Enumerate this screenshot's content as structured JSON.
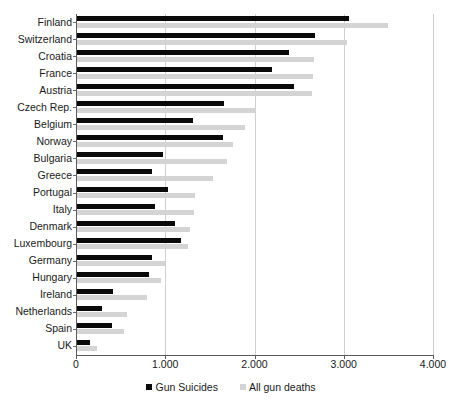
{
  "chart_data": {
    "type": "bar",
    "orientation": "horizontal",
    "title": "",
    "subtitle": "",
    "xlabel": "",
    "ylabel": "",
    "xlim": [
      0,
      4000
    ],
    "grid": true,
    "legend_position": "bottom",
    "tick_labels": [
      "0",
      "1.000",
      "2.000",
      "3.000",
      "4.000"
    ],
    "tick_values": [
      0,
      1000,
      2000,
      3000,
      4000
    ],
    "categories": [
      "Finland",
      "Switzerland",
      "Croatia",
      "France",
      "Austria",
      "Czech Rep.",
      "Belgium",
      "Norway",
      "Bulgaria",
      "Greece",
      "Portugal",
      "Italy",
      "Denmark",
      "Luxembourg",
      "Germany",
      "Hungary",
      "Ireland",
      "Netherlands",
      "Spain",
      "UK"
    ],
    "series": [
      {
        "name": "Gun Suicides",
        "color": "#0a0a0a",
        "values": [
          3060,
          2680,
          2390,
          2200,
          2440,
          1660,
          1310,
          1650,
          980,
          850,
          1030,
          880,
          1110,
          1180,
          850,
          820,
          420,
          290,
          400,
          160
        ]
      },
      {
        "name": "All gun deaths",
        "color": "#d4d4d4",
        "values": [
          3500,
          3040,
          2670,
          2660,
          2640,
          2020,
          1890,
          1760,
          1690,
          1540,
          1330,
          1320,
          1280,
          1250,
          1000,
          950,
          790,
          570,
          540,
          230
        ]
      }
    ]
  },
  "legend": {
    "items": [
      {
        "label": "Gun Suicides",
        "color": "#0a0a0a",
        "swatch_name": "legend-swatch-gun-suicides"
      },
      {
        "label": "All gun deaths",
        "color": "#d4d4d4",
        "swatch_name": "legend-swatch-all-gun-deaths"
      }
    ]
  },
  "colors": {
    "series_dark": "#0a0a0a",
    "series_light": "#d4d4d4",
    "axis": "#5a5a5a",
    "gridline": "#cfcfcf",
    "background": "#ffffff",
    "text": "#1a1a1a"
  }
}
